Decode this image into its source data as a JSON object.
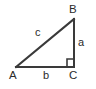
{
  "figure": {
    "kind": "right-triangle-diagram",
    "background_color": "#ffffff",
    "stroke_color": "#3a3a3a",
    "text_color": "#2b2b2b",
    "stroke_width": 2,
    "width": 96,
    "height": 89
  },
  "vertices": [
    {
      "id": "A",
      "label": "A",
      "x": 16,
      "y": 67,
      "position": "bottom-left"
    },
    {
      "id": "B",
      "label": "B",
      "x": 74,
      "y": 19,
      "position": "top-right"
    },
    {
      "id": "C",
      "label": "C",
      "x": 74,
      "y": 67,
      "position": "bottom-right",
      "right_angle": true
    }
  ],
  "sides": [
    {
      "id": "a",
      "label": "a",
      "from": "B",
      "to": "C",
      "role": "opposite-leg-vertical"
    },
    {
      "id": "b",
      "label": "b",
      "from": "A",
      "to": "C",
      "role": "adjacent-leg-horizontal"
    },
    {
      "id": "c",
      "label": "c",
      "from": "A",
      "to": "B",
      "role": "hypotenuse"
    }
  ],
  "markers": [
    {
      "id": "right-angle-square",
      "at_vertex": "C",
      "size": 7
    }
  ]
}
